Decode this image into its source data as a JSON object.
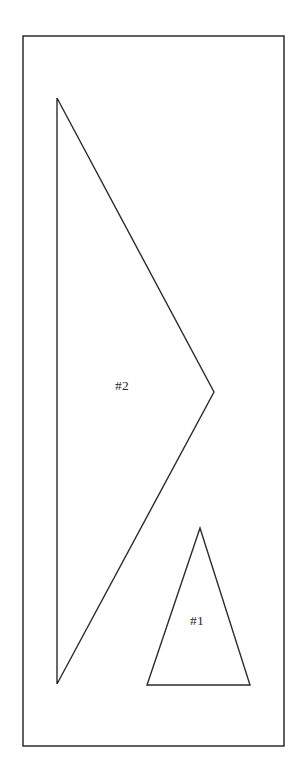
{
  "figure": {
    "background_color": "#ffffff",
    "stroke_color": "#2b2b2b",
    "canvas": {
      "width": 306,
      "height": 783
    },
    "border": {
      "name": "outer-rectangle",
      "x": 23,
      "y": 36,
      "width": 261,
      "height": 710,
      "points": "23,36 284,36 284,746 23,746"
    },
    "shapes": [
      {
        "id": "shape-2",
        "label": "#2",
        "type": "arrowhead-triangle",
        "points": "57,98 214,392 57,684",
        "vertices": [
          {
            "x": 57,
            "y": 98
          },
          {
            "x": 214,
            "y": 392
          },
          {
            "x": 57,
            "y": 684
          }
        ],
        "label_position": {
          "x": 122,
          "y": 387
        }
      },
      {
        "id": "shape-1",
        "label": "#1",
        "type": "triangle",
        "points": "200,528 250,685 147,685",
        "vertices": [
          {
            "x": 200,
            "y": 528
          },
          {
            "x": 250,
            "y": 685
          },
          {
            "x": 147,
            "y": 685
          }
        ],
        "label_position": {
          "x": 197,
          "y": 622
        }
      }
    ]
  }
}
